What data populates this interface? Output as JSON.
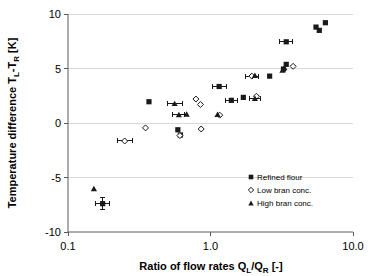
{
  "chart_data": {
    "type": "scatter",
    "title": "",
    "xlabel": "Ratio of flow rates QL/QR [-]",
    "xlabel_parts": {
      "pre": "Ratio of flow rates Q",
      "sub1": "L",
      "mid": "/Q",
      "sub2": "R",
      "post": " [-]"
    },
    "ylabel": "Temperature difference TL-TR [K]",
    "ylabel_parts": {
      "pre": "Temperature difference T",
      "sub1": "L",
      "mid": "-T",
      "sub2": "R",
      "post": " [K]"
    },
    "xscale": "log",
    "xlim": [
      0.1,
      10.0
    ],
    "ylim": [
      -10,
      10
    ],
    "xticks": [
      0.1,
      1.0,
      10.0
    ],
    "xtick_labels": [
      "0.1",
      "1.0",
      "10.0"
    ],
    "yticks": [
      -10,
      -5,
      0,
      5,
      10
    ],
    "ytick_labels": [
      "-10",
      "-5",
      "0",
      "5",
      "10"
    ],
    "grid": "horizontal",
    "legend_position": "bottom-right",
    "series": [
      {
        "name": "Refined flour",
        "marker": "square",
        "color": "#1a1a1a",
        "points": [
          {
            "x": 0.175,
            "y": -7.4,
            "xerr_lo": 0.018,
            "xerr_hi": 0.02,
            "yerr": 0.55
          },
          {
            "x": 0.37,
            "y": 1.95,
            "xerr_lo": 0.0,
            "xerr_hi": 0.0,
            "yerr": 0.0
          },
          {
            "x": 0.59,
            "y": -0.62,
            "xerr_lo": 0.0,
            "xerr_hi": 0.0,
            "yerr": 0.0
          },
          {
            "x": 0.615,
            "y": -1.1,
            "xerr_lo": 0.0,
            "xerr_hi": 0.0,
            "yerr": 0.0
          },
          {
            "x": 1.15,
            "y": 3.35,
            "xerr_lo": 0.11,
            "xerr_hi": 0.14,
            "yerr": 0.0
          },
          {
            "x": 1.4,
            "y": 2.08,
            "xerr_lo": 0.13,
            "xerr_hi": 0.15,
            "yerr": 0.0
          },
          {
            "x": 1.7,
            "y": 2.35,
            "xerr_lo": 0.0,
            "xerr_hi": 0.0,
            "yerr": 0.0
          },
          {
            "x": 2.6,
            "y": 4.3,
            "xerr_lo": 0.0,
            "xerr_hi": 0.0,
            "yerr": 0.0
          },
          {
            "x": 3.25,
            "y": 4.95,
            "xerr_lo": 0.0,
            "xerr_hi": 0.0,
            "yerr": 0.0
          },
          {
            "x": 3.4,
            "y": 5.38,
            "xerr_lo": 0.0,
            "xerr_hi": 0.0,
            "yerr": 0.0
          },
          {
            "x": 3.4,
            "y": 7.45,
            "xerr_lo": 0.33,
            "xerr_hi": 0.38,
            "yerr": 0.0
          },
          {
            "x": 5.5,
            "y": 8.8,
            "xerr_lo": 0.0,
            "xerr_hi": 0.0,
            "yerr": 0.0
          },
          {
            "x": 5.8,
            "y": 8.5,
            "xerr_lo": 0.0,
            "xerr_hi": 0.0,
            "yerr": 0.0
          },
          {
            "x": 6.4,
            "y": 9.2,
            "xerr_lo": 0.0,
            "xerr_hi": 0.0,
            "yerr": 0.0
          }
        ]
      },
      {
        "name": "Low bran conc.",
        "marker": "diamond",
        "color": "#ffffff",
        "points": [
          {
            "x": 0.25,
            "y": -1.65,
            "xerr_lo": 0.028,
            "xerr_hi": 0.032,
            "yerr": 0.0
          },
          {
            "x": 0.35,
            "y": -0.45,
            "xerr_lo": 0.0,
            "xerr_hi": 0.0,
            "yerr": 0.0
          },
          {
            "x": 0.61,
            "y": -1.15,
            "xerr_lo": 0.0,
            "xerr_hi": 0.0,
            "yerr": 0.0
          },
          {
            "x": 0.79,
            "y": 2.2,
            "xerr_lo": 0.0,
            "xerr_hi": 0.0,
            "yerr": 0.0
          },
          {
            "x": 0.85,
            "y": 1.7,
            "xerr_lo": 0.0,
            "xerr_hi": 0.0,
            "yerr": 0.0
          },
          {
            "x": 0.86,
            "y": -0.55,
            "xerr_lo": 0.0,
            "xerr_hi": 0.0,
            "yerr": 0.0
          },
          {
            "x": 1.16,
            "y": 0.72,
            "xerr_lo": 0.0,
            "xerr_hi": 0.0,
            "yerr": 0.0
          },
          {
            "x": 1.95,
            "y": 4.3,
            "xerr_lo": 0.18,
            "xerr_hi": 0.22,
            "yerr": 0.0
          },
          {
            "x": 2.1,
            "y": 2.45,
            "xerr_lo": 0.0,
            "xerr_hi": 0.0,
            "yerr": 0.0
          },
          {
            "x": 3.8,
            "y": 5.2,
            "xerr_lo": 0.0,
            "xerr_hi": 0.0,
            "yerr": 0.0
          }
        ]
      },
      {
        "name": "High bran conc.",
        "marker": "triangle",
        "color": "#1a1a1a",
        "points": [
          {
            "x": 0.152,
            "y": -6.0,
            "xerr_lo": 0.0,
            "xerr_hi": 0.0,
            "yerr": 0.0
          },
          {
            "x": 0.56,
            "y": 1.8,
            "xerr_lo": 0.06,
            "xerr_hi": 0.075,
            "yerr": 0.0
          },
          {
            "x": 0.6,
            "y": 0.78,
            "xerr_lo": 0.058,
            "xerr_hi": 0.062,
            "yerr": 0.0
          },
          {
            "x": 0.68,
            "y": 0.82,
            "xerr_lo": 0.0,
            "xerr_hi": 0.0,
            "yerr": 0.0
          },
          {
            "x": 1.12,
            "y": 0.8,
            "xerr_lo": 0.0,
            "xerr_hi": 0.0,
            "yerr": 0.0
          },
          {
            "x": 2.05,
            "y": 2.28,
            "xerr_lo": 0.17,
            "xerr_hi": 0.19,
            "yerr": 0.0
          },
          {
            "x": 2.05,
            "y": 4.38,
            "xerr_lo": 0.0,
            "xerr_hi": 0.0,
            "yerr": 0.0
          },
          {
            "x": 3.2,
            "y": 4.85,
            "xerr_lo": 0.0,
            "xerr_hi": 0.0,
            "yerr": 0.0
          },
          {
            "x": 3.3,
            "y": 5.1,
            "xerr_lo": 0.0,
            "xerr_hi": 0.0,
            "yerr": 0.0
          }
        ]
      }
    ]
  },
  "legend": {
    "entries": [
      {
        "label": "Refined flour",
        "marker": "square"
      },
      {
        "label": "Low bran conc.",
        "marker": "diamond"
      },
      {
        "label": "High bran conc.",
        "marker": "triangle"
      }
    ]
  },
  "colors": {
    "marker_fill": "#1a1a1a",
    "open_marker_fill": "#ffffff",
    "grid": "#d9d9d9",
    "axis": "#5a5a5a",
    "background": "#ffffff"
  }
}
